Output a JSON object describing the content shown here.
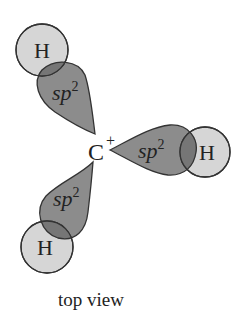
{
  "diagram": {
    "center_atom": "C",
    "charge": "+",
    "orbital_label": "sp",
    "orbital_superscript": "2",
    "substituents": [
      {
        "atom": "H",
        "position": "upper-left"
      },
      {
        "atom": "H",
        "position": "right"
      },
      {
        "atom": "H",
        "position": "lower-left"
      }
    ],
    "caption": "top view",
    "colors": {
      "lobe_fill": "#8c8c8c",
      "h_fill": "#cfcfcf",
      "overlap_fill": "#767676",
      "stroke": "#333333"
    }
  }
}
